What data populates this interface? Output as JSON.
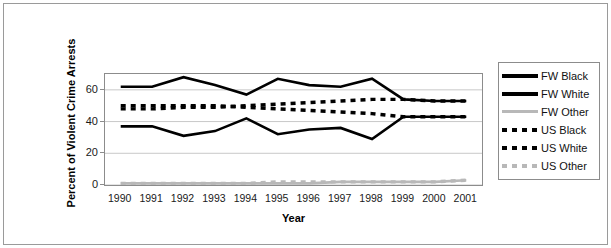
{
  "chart_data": {
    "type": "line",
    "title": "",
    "xlabel": "Year",
    "ylabel": "Percent of Violent Crime Arrests",
    "ylim": [
      0,
      70
    ],
    "yticks": [
      0,
      20,
      40,
      60
    ],
    "grid": true,
    "legend_position": "right",
    "categories": [
      "1990",
      "1991",
      "1992",
      "1993",
      "1994",
      "1995",
      "1996",
      "1997",
      "1998",
      "1999",
      "2000",
      "2001"
    ],
    "series": [
      {
        "name": "FW Black",
        "style": "solid",
        "color": "#000000",
        "values": [
          62,
          62,
          68,
          63,
          57,
          67,
          63,
          62,
          67,
          54,
          53,
          53
        ]
      },
      {
        "name": "FW White",
        "style": "solid",
        "color": "#000000",
        "values": [
          37,
          37,
          31,
          34,
          42,
          32,
          35,
          36,
          29,
          43,
          43,
          43
        ]
      },
      {
        "name": "FW Other",
        "style": "solid",
        "color": "#b8b8b8",
        "values": [
          1,
          1,
          1,
          1,
          1,
          1,
          1,
          2,
          2,
          2,
          2,
          3
        ]
      },
      {
        "name": "US Black",
        "style": "dashed",
        "color": "#000000",
        "values": [
          50,
          50,
          50,
          50,
          49,
          48,
          47,
          46,
          45,
          43,
          43,
          43
        ]
      },
      {
        "name": "US White",
        "style": "dashed",
        "color": "#000000",
        "values": [
          48,
          48,
          49,
          49,
          50,
          51,
          52,
          53,
          54,
          54,
          53,
          53
        ]
      },
      {
        "name": "US Other",
        "style": "dashed",
        "color": "#b8b8b8",
        "values": [
          1,
          1,
          1,
          1,
          1,
          2,
          2,
          2,
          2,
          2,
          2,
          3
        ]
      }
    ]
  },
  "legend": {
    "items": [
      {
        "label": "FW Black",
        "style": "solid",
        "color": "#000000",
        "icon": "solid-line-swatch"
      },
      {
        "label": "FW White",
        "style": "solid",
        "color": "#000000",
        "icon": "solid-line-swatch"
      },
      {
        "label": "FW Other",
        "style": "solid",
        "color": "#b8b8b8",
        "icon": "solid-line-swatch"
      },
      {
        "label": "US Black",
        "style": "dashed",
        "color": "#000000",
        "icon": "dashed-line-swatch"
      },
      {
        "label": "US White",
        "style": "dashed",
        "color": "#000000",
        "icon": "dashed-line-swatch"
      },
      {
        "label": "US Other",
        "style": "dashed",
        "color": "#b8b8b8",
        "icon": "dashed-line-swatch"
      }
    ]
  },
  "axes": {
    "y_title": "Percent of Violent Crime Arrests",
    "x_title": "Year",
    "y_tick_labels": [
      "60",
      "40",
      "20",
      "0"
    ],
    "x_tick_labels": [
      "1990",
      "1991",
      "1992",
      "1993",
      "1994",
      "1995",
      "1996",
      "1997",
      "1998",
      "1999",
      "2000",
      "2001"
    ]
  },
  "colors": {
    "plot_border": "#8c8c8c",
    "gridline": "#c8c8c8",
    "figure_border": "#9a9a9a",
    "text": "#1a1a1a",
    "series_black": "#000000",
    "series_gray": "#b8b8b8"
  }
}
